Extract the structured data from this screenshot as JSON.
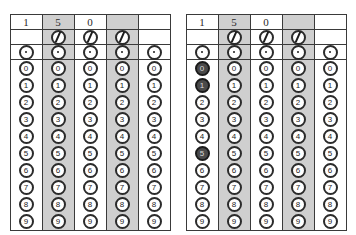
{
  "sheet": {
    "title": "gridded-response-answer-grid",
    "answer_text": "150",
    "columns": 5,
    "digits": [
      "0",
      "1",
      "2",
      "3",
      "4",
      "5",
      "6",
      "7",
      "8",
      "9"
    ],
    "shaded_columns": [
      2,
      4
    ],
    "shade_color": "#cfcfcf",
    "filled_color": "#4a4a4a",
    "border_color": "#3a3a3a",
    "rows": {
      "header_label": "written-answer-row",
      "slash_label": "fraction-slash-row",
      "decimal_label": "decimal-point-row",
      "digit_label": "digit-bubble-rows"
    },
    "panels": [
      {
        "name": "grid-left",
        "header": [
          "1",
          "5",
          "0",
          "",
          ""
        ],
        "slash_cells": [
          false,
          true,
          true,
          true,
          false
        ],
        "decimal_cells": [
          true,
          true,
          true,
          true,
          true
        ],
        "filled": [
          [],
          [],
          [],
          [],
          []
        ]
      },
      {
        "name": "grid-right",
        "header": [
          "1",
          "5",
          "0",
          "",
          ""
        ],
        "slash_cells": [
          false,
          true,
          true,
          true,
          false
        ],
        "decimal_cells": [
          true,
          true,
          true,
          true,
          true
        ],
        "filled": [
          [
            "0",
            "1",
            "5"
          ],
          [],
          [],
          [],
          []
        ]
      }
    ]
  }
}
